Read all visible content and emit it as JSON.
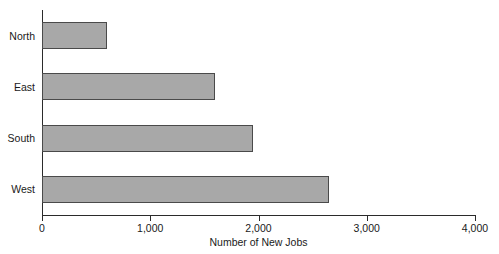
{
  "chart_data": {
    "type": "bar",
    "orientation": "horizontal",
    "title": "",
    "xlabel": "Number of New Jobs",
    "ylabel": "",
    "categories": [
      "North",
      "East",
      "South",
      "West"
    ],
    "values": [
      600,
      1600,
      1950,
      2650
    ],
    "xlim": [
      0,
      4000
    ],
    "xticks": [
      0,
      1000,
      2000,
      3000,
      4000
    ],
    "xtick_labels": [
      "0",
      "1,000",
      "2,000",
      "3,000",
      "4,000"
    ],
    "grid": false,
    "legend": false,
    "bar_fill_color": "#a8a8a8",
    "bar_edge_color": "#4a4a4a",
    "axis_color": "#2b2b2b",
    "background_color": "#ffffff"
  }
}
